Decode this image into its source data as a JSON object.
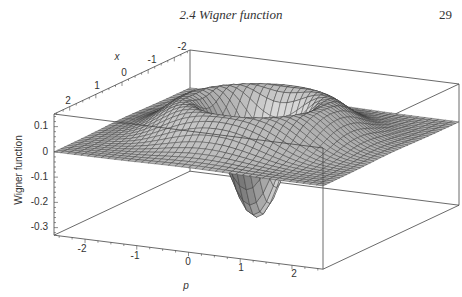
{
  "header": {
    "running_title": "2.4  Wigner function",
    "page_number": "29"
  },
  "chart_data": {
    "type": "surface3d",
    "title": "",
    "xlabel": "p",
    "ylabel": "x",
    "zlabel": "Wigner function",
    "p_ticks": [
      "-2",
      "-1",
      "0",
      "1",
      "2"
    ],
    "x_ticks": [
      "2",
      "1",
      "0",
      "-1",
      "-2"
    ],
    "z_ticks": [
      "0.1",
      "0",
      "-0.1",
      "-0.2",
      "-0.3"
    ],
    "p_range": [
      -2.6,
      2.6
    ],
    "x_range": [
      -2.6,
      2.6
    ],
    "z_range": [
      -0.33,
      0.15
    ],
    "minimum": {
      "x": 0,
      "p": 0,
      "W": -0.318
    },
    "ring_maximum": {
      "r": 1.22,
      "W": 0.142
    },
    "surface_color": "#b4b4b4",
    "mesh_color": "#3a3a3a",
    "grid": false
  }
}
